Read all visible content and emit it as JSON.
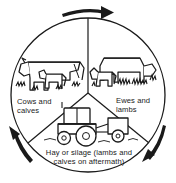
{
  "diagram": {
    "type": "cyclical-rotation-diagram",
    "title": "",
    "shape": "circle divided into three sectors with clockwise arrows",
    "stroke_color": "#1a1a1a",
    "background_color": "#ffffff",
    "text_color": "#1a1a1a",
    "segments": [
      {
        "id": "cows",
        "label": "Cows and\ncalves",
        "icon": "cow-and-calf-icon",
        "position": "upper-left"
      },
      {
        "id": "ewes",
        "label": "Ewes and\nlambs",
        "icon": "ewe-and-lamb-icon",
        "position": "upper-right"
      },
      {
        "id": "hay",
        "label": "Hay or silage (lambs and\ncalves on aftermath)",
        "icon": "tractor-icon",
        "position": "bottom"
      }
    ],
    "arrows": [
      {
        "id": "arrow-top",
        "direction": "clockwise-right",
        "position": "top"
      },
      {
        "id": "arrow-bottom-right",
        "direction": "clockwise-down-left",
        "position": "bottom-right"
      },
      {
        "id": "arrow-bottom-left",
        "direction": "clockwise-up-left",
        "position": "bottom-left"
      }
    ]
  }
}
